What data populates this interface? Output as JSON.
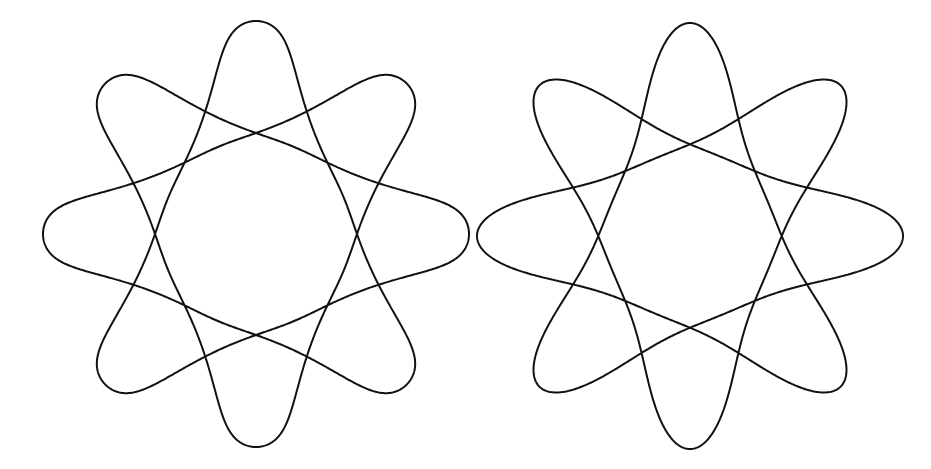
{
  "figure": {
    "background": "#ffffff",
    "stroke_color": "#111111",
    "stroke_width": 2,
    "curves": [
      {
        "name": "left-star-curve",
        "style": "rounded-tips",
        "center": [
          256,
          234
        ],
        "rotation_deg": -90,
        "symmetry": 8,
        "harmonics": [
          {
            "freq": 3,
            "amp": 150,
            "phase": 0
          },
          {
            "freq": -5,
            "amp": 52,
            "phase": 0
          },
          {
            "freq": 11,
            "amp": 10,
            "phase": 0
          },
          {
            "freq": -13,
            "amp": 4,
            "phase": 0
          },
          {
            "freq": -21,
            "amp": -3,
            "phase": 0
          }
        ]
      },
      {
        "name": "right-star-curve",
        "style": "cusp-tips",
        "center": [
          690,
          236
        ],
        "rotation_deg": -90,
        "symmetry": 8,
        "harmonics": [
          {
            "freq": 3,
            "amp": 140,
            "phase": 0
          },
          {
            "freq": -5,
            "amp": 48,
            "phase": 0
          },
          {
            "freq": 11,
            "amp": 16,
            "phase": 0
          },
          {
            "freq": -13,
            "amp": 6,
            "phase": 0
          },
          {
            "freq": 19,
            "amp": 3,
            "phase": 0
          }
        ]
      }
    ]
  }
}
